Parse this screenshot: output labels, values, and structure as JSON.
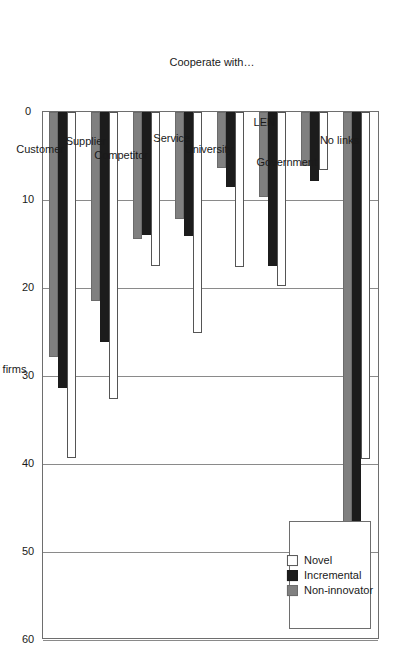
{
  "chart_data": {
    "type": "bar",
    "title": "",
    "orientation": "rotated-90",
    "xlabel": "Cooperate with…",
    "ylabel": "% of firms",
    "ylim": [
      0,
      60
    ],
    "yticks": [
      0,
      10,
      20,
      30,
      40,
      50,
      60
    ],
    "ytick_labels": [
      "0",
      "10",
      "20",
      "30",
      "40",
      "50",
      "60"
    ],
    "grid": true,
    "legend_position": "top-right",
    "categories": [
      "No links",
      "Government",
      "LEN",
      "University",
      "Service",
      "Competitor",
      "Supplier",
      "Customer"
    ],
    "series": [
      {
        "name": "Novel",
        "color": "#ffffff",
        "values": [
          39.4,
          6.6,
          19.8,
          17.6,
          25.1,
          17.5,
          32.6,
          39.3
        ]
      },
      {
        "name": "Incremental",
        "color": "#1c1c1c",
        "values": [
          49.3,
          7.8,
          17.5,
          8.5,
          14.1,
          14.0,
          26.1,
          31.4
        ]
      },
      {
        "name": "Non-innovator",
        "color": "#808080",
        "values": [
          54.4,
          6.1,
          9.7,
          6.4,
          12.2,
          14.4,
          21.5,
          27.8
        ]
      }
    ]
  },
  "legend": {
    "entries": [
      {
        "label": "Novel",
        "swatch": "novel"
      },
      {
        "label": "Incremental",
        "swatch": "incremental"
      },
      {
        "label": "Non-innovator",
        "swatch": "noninnovator"
      }
    ]
  },
  "axes": {
    "value_axis_title": "% of firms",
    "category_axis_title": "Cooperate with…"
  },
  "colors": {
    "novel": "#ffffff",
    "incremental": "#1c1c1c",
    "non_innovator": "#808080",
    "axis": "#6e6e6e",
    "grid": "#8a8a8a",
    "background": "#ffffff"
  }
}
